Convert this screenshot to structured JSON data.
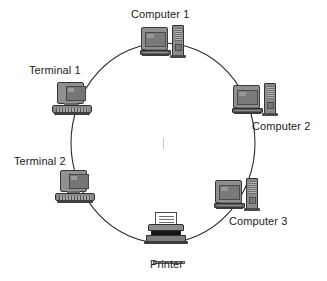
{
  "diagram": {
    "background_color": "#ffffff",
    "ring": {
      "stroke_color": "#2b2b2b",
      "stroke_width": 1,
      "center_x": 163,
      "center_y": 143,
      "radius_x": 92,
      "radius_y": 100
    },
    "nodes": [
      {
        "id": "computer-1",
        "label": "Computer 1",
        "type": "desktop-computer",
        "icon": "computer-tower-icon",
        "icon_x": 141,
        "icon_y": 25,
        "label_x": 131,
        "label_y": 8
      },
      {
        "id": "computer-2",
        "label": "Computer 2",
        "type": "desktop-computer",
        "icon": "computer-tower-icon",
        "icon_x": 233,
        "icon_y": 83,
        "label_x": 252,
        "label_y": 120
      },
      {
        "id": "computer-3",
        "label": "Computer 3",
        "type": "desktop-computer",
        "icon": "computer-tower-icon",
        "icon_x": 215,
        "icon_y": 178,
        "label_x": 229,
        "label_y": 215
      },
      {
        "id": "printer",
        "label": "Printer",
        "type": "printer",
        "icon": "printer-icon",
        "icon_x": 144,
        "icon_y": 212,
        "label_x": 150,
        "label_y": 258
      },
      {
        "id": "terminal-2",
        "label": "Terminal 2",
        "type": "terminal",
        "icon": "terminal-icon",
        "icon_x": 55,
        "icon_y": 170,
        "label_x": 14,
        "label_y": 155
      },
      {
        "id": "terminal-1",
        "label": "Terminal 1",
        "type": "terminal",
        "icon": "terminal-icon",
        "icon_x": 52,
        "icon_y": 82,
        "label_x": 29,
        "label_y": 64
      }
    ]
  }
}
